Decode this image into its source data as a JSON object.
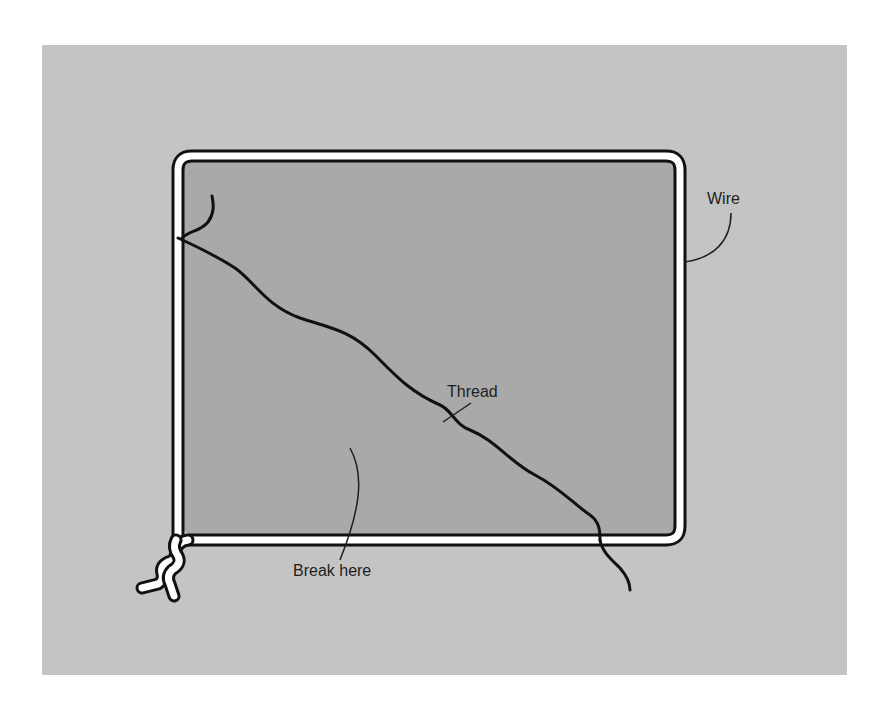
{
  "diagram": {
    "labels": {
      "wire": "Wire",
      "thread": "Thread",
      "break_here": "Break here"
    },
    "colors": {
      "page_background": "#ffffff",
      "panel_background": "#c4c4c4",
      "film_fill": "#a9a9a9",
      "wire_fill": "#ffffff",
      "outline": "#111111",
      "text": "#1e1e1e"
    }
  }
}
